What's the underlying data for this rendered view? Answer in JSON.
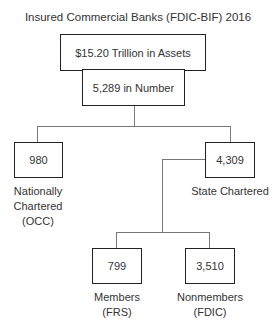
{
  "title": "Insured Commercial Banks (FDIC-BIF) 2016",
  "root": {
    "assets": "$15.20 Trillion in Assets",
    "number": "5,289 in Number"
  },
  "branches": {
    "national": {
      "value": "980",
      "label_lines": [
        "Nationally",
        "Chartered",
        "(OCC)"
      ]
    },
    "state": {
      "value": "4,309",
      "label_lines": [
        "State Chartered"
      ]
    }
  },
  "state_children": {
    "members": {
      "value": "799",
      "label_lines": [
        "Members",
        "(FRS)"
      ]
    },
    "nonmembers": {
      "value": "3,510",
      "label_lines": [
        "Nonmembers",
        "(FDIC)"
      ]
    }
  }
}
